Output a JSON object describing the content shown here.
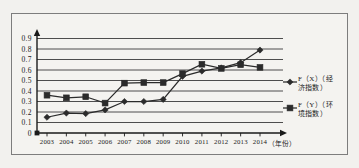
{
  "chart_data": {
    "type": "line",
    "title": "",
    "xlabel": "（年份）",
    "ylabel": "",
    "x": [
      2003,
      2004,
      2005,
      2006,
      2007,
      2008,
      2009,
      2010,
      2011,
      2012,
      2013,
      2014
    ],
    "categories": [
      "2003",
      "2004",
      "2005",
      "2006",
      "2007",
      "2008",
      "2009",
      "2010",
      "2011",
      "2012",
      "2013",
      "2014"
    ],
    "ylim": [
      0,
      0.9
    ],
    "xlim": [
      2003,
      2014
    ],
    "yticks": [
      "0",
      "0.1",
      "0.2",
      "0.3",
      "0.4",
      "0.5",
      "0.6",
      "0.7",
      "0.8",
      "0.9"
    ],
    "ytick_values": [
      0,
      0.1,
      0.2,
      0.3,
      0.4,
      0.5,
      0.6,
      0.7,
      0.8,
      0.9
    ],
    "grid": true,
    "legend_position": "right",
    "series": [
      {
        "name": "F（X）（经济指数）",
        "marker": "diamond",
        "color": "#2b2b2b",
        "values": [
          0.15,
          0.19,
          0.185,
          0.22,
          0.3,
          0.3,
          0.32,
          0.54,
          0.59,
          0.62,
          0.67,
          0.79
        ]
      },
      {
        "name": "F（Y）（环境指数）",
        "marker": "square",
        "color": "#2b2b2b",
        "values": [
          0.36,
          0.335,
          0.345,
          0.285,
          0.475,
          0.48,
          0.48,
          0.565,
          0.655,
          0.615,
          0.65,
          0.625
        ]
      }
    ]
  },
  "legend": {
    "items": [
      {
        "label_line1": "F（X）（经",
        "label_line2": "济指数）",
        "marker": "diamond"
      },
      {
        "label_line1": "F（Y）（环",
        "label_line2": "境指数）",
        "marker": "square"
      }
    ]
  },
  "axis": {
    "x_unit_label": "（年份）"
  }
}
